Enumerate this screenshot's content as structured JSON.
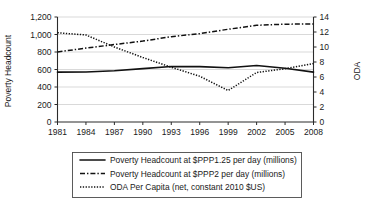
{
  "chart_data": {
    "type": "line",
    "title": "",
    "xlabel": "",
    "ylabel": "Poverty Headcount",
    "y2label": "ODA",
    "grid": true,
    "legend_position": "bottom",
    "x": [
      1981,
      1984,
      1987,
      1990,
      1993,
      1996,
      1999,
      2002,
      2005,
      2008
    ],
    "xticklabels": [
      "1981",
      "1984",
      "1987",
      "1990",
      "1993",
      "1996",
      "1999",
      "2002",
      "2005",
      "2008"
    ],
    "xlim": [
      1981,
      2008
    ],
    "ylim": [
      0,
      1200
    ],
    "yticks": [
      0,
      200,
      400,
      600,
      800,
      1000,
      1200
    ],
    "yticklabels": [
      "0",
      "200",
      "400",
      "600",
      "800",
      "1,000",
      "1,200"
    ],
    "y2lim": [
      0,
      14
    ],
    "y2ticks": [
      0,
      2,
      4,
      6,
      8,
      10,
      12,
      14
    ],
    "y2ticklabels": [
      "0",
      "2",
      "4",
      "6",
      "8",
      "10",
      "12",
      "14"
    ],
    "series": [
      {
        "name": "Poverty Headcount at $PPP1.25 per day (millions)",
        "axis": "left",
        "style": "solid",
        "values": [
          570,
          572,
          585,
          610,
          635,
          633,
          620,
          645,
          615,
          570
        ]
      },
      {
        "name": "Poverty Headcount at $PPP2 per day (millions)",
        "axis": "left",
        "style": "dash-dot",
        "values": [
          800,
          845,
          885,
          925,
          975,
          1010,
          1060,
          1105,
          1118,
          1120
        ]
      },
      {
        "name": "ODA Per Capita (net, constant 2010 $US)",
        "axis": "right",
        "style": "dotted",
        "values": [
          11.9,
          11.6,
          10.0,
          8.6,
          7.3,
          6.1,
          4.2,
          6.6,
          7.1,
          7.8
        ]
      }
    ]
  },
  "legend": {
    "items": [
      {
        "label": "Poverty Headcount at $PPP1.25 per day (millions)",
        "style": "solid"
      },
      {
        "label": "Poverty Headcount at $PPP2 per day (millions)",
        "style": "dash-dot"
      },
      {
        "label": "ODA Per Capita (net, constant 2010 $US)",
        "style": "dotted"
      }
    ]
  }
}
